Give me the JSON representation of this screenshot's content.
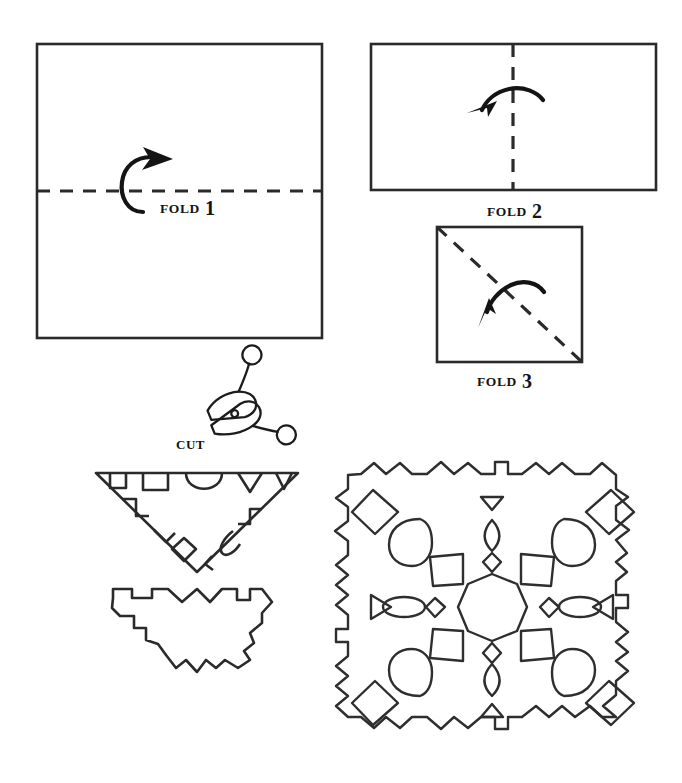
{
  "diagram": {
    "ink_color": "#2a2a2a",
    "background_color": "#ffffff"
  },
  "steps": [
    {
      "id": "fold-1",
      "word": "FOLD",
      "number": "1",
      "shape": "square",
      "fold_line": "horizontal-center",
      "arrow_direction": "up-right",
      "label_x": 160,
      "label_y": 196
    },
    {
      "id": "fold-2",
      "word": "FOLD",
      "number": "2",
      "shape": "wide-rectangle",
      "fold_line": "vertical-center",
      "arrow_direction": "left",
      "label_x": 487,
      "label_y": 199
    },
    {
      "id": "fold-3",
      "word": "FOLD",
      "number": "3",
      "shape": "square",
      "fold_line": "diagonal-topleft-to-bottomright",
      "arrow_direction": "down-left",
      "label_x": 477,
      "label_y": 369
    }
  ],
  "cut": {
    "label": "CUT",
    "icon": "scissors-icon",
    "label_x": 176,
    "label_y": 437
  },
  "panels": {
    "folded_triangle": {
      "name": "folded-triangle-with-cut-marks",
      "description": "Inverted triangle of folded paper with notch shapes marked along its edges"
    },
    "cut_piece": {
      "name": "cut-folded-piece",
      "description": "The folded paper after the notches have been cut away"
    },
    "unfolded_snowflake": {
      "name": "unfolded-snowflake",
      "description": "The finished paper snowflake after unfolding, four-fold symmetric",
      "center_shape": "octagon",
      "motifs": [
        "octagon",
        "diamond",
        "leaf",
        "square",
        "triangle",
        "ellipse",
        "small-diamond"
      ],
      "edge_pattern": "castellated-sawtooth"
    }
  }
}
